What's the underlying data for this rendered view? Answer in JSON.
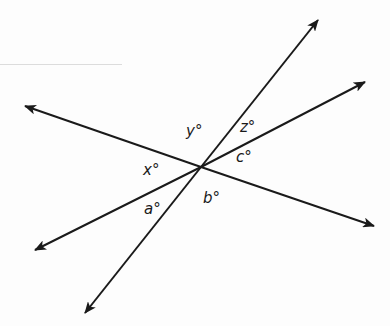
{
  "diagram": {
    "type": "intersecting-lines",
    "line_color": "#1a1a1a",
    "intersection": {
      "x": 201,
      "y": 167
    },
    "lines": [
      {
        "name": "line-1",
        "from": {
          "x": 25,
          "y": 106
        },
        "to": {
          "x": 374,
          "y": 226
        }
      },
      {
        "name": "line-2",
        "from": {
          "x": 85,
          "y": 313
        },
        "to": {
          "x": 318,
          "y": 20
        }
      },
      {
        "name": "line-3",
        "from": {
          "x": 35,
          "y": 250
        },
        "to": {
          "x": 365,
          "y": 82
        }
      }
    ],
    "angles": {
      "y": "y°",
      "z": "z°",
      "c": "c°",
      "x": "x°",
      "a": "a°",
      "b": "b°"
    }
  }
}
